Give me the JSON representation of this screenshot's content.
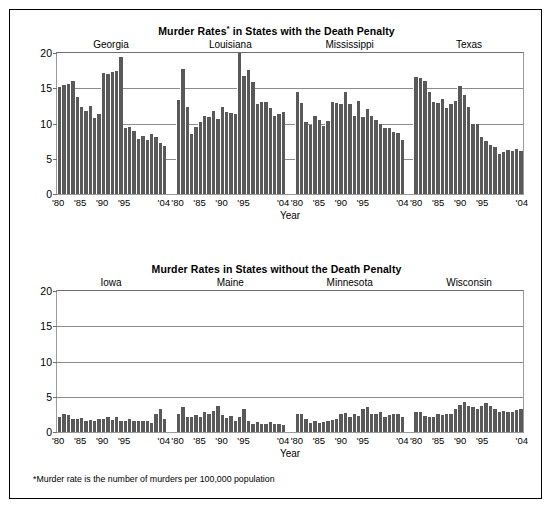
{
  "figure": {
    "footnote": "*Murder rate is the number of murders per 100,000 population",
    "bar_color": "#595959",
    "grid_color": "#8c8c8c",
    "frame_color": "#000000"
  },
  "chart_data": [
    {
      "type": "bar",
      "title": "Murder Rates* in States with the Death Penalty",
      "title_plain": "Murder Rates",
      "title_sup": "*",
      "title_rest": " in States with the Death Penalty",
      "xlabel": "Year",
      "ylabel": "",
      "ylim": [
        0,
        20
      ],
      "yticks": [
        0,
        5,
        10,
        15,
        20
      ],
      "ytick_labels": [
        "0",
        "5",
        "10",
        "15",
        "20"
      ],
      "grid": true,
      "legend": "none",
      "x": [
        1980,
        1981,
        1982,
        1983,
        1984,
        1985,
        1986,
        1987,
        1988,
        1989,
        1990,
        1991,
        1992,
        1993,
        1994,
        1995,
        1996,
        1997,
        1998,
        1999,
        2000,
        2001,
        2002,
        2003,
        2004
      ],
      "xtick_years": [
        1980,
        1985,
        1990,
        1995,
        2004
      ],
      "xtick_labels": [
        "'80",
        "'85",
        "'90",
        "'95",
        "'04"
      ],
      "panels": [
        {
          "name": "Georgia",
          "values": [
            15.2,
            15.4,
            15.6,
            16.0,
            13.7,
            12.4,
            11.8,
            12.5,
            10.8,
            11.3,
            17.2,
            17.0,
            17.3,
            17.5,
            19.4,
            9.4,
            9.5,
            9.0,
            7.8,
            8.2,
            7.7,
            8.5,
            8.1,
            7.2,
            6.8
          ]
        },
        {
          "name": "Louisiana",
          "values": [
            13.3,
            17.7,
            12.4,
            8.5,
            9.5,
            10.2,
            11.1,
            10.9,
            11.8,
            10.6,
            12.4,
            11.6,
            11.5,
            11.3,
            20.0,
            16.8,
            17.6,
            15.9,
            12.8,
            13.0,
            13.0,
            12.2,
            11.1,
            11.3,
            11.7
          ]
        },
        {
          "name": "Mississippi",
          "values": [
            14.4,
            12.9,
            10.2,
            9.8,
            11.0,
            10.5,
            9.6,
            10.3,
            13.0,
            12.9,
            12.7,
            14.5,
            12.8,
            11.0,
            13.2,
            10.9,
            12.0,
            11.1,
            10.5,
            9.9,
            9.4,
            9.3,
            8.8,
            8.7,
            7.7
          ]
        },
        {
          "name": "Texas",
          "values": [
            16.6,
            16.5,
            16.1,
            14.4,
            13.1,
            12.9,
            13.5,
            12.2,
            12.7,
            13.2,
            15.3,
            14.0,
            12.3,
            10.0,
            10.0,
            8.1,
            7.5,
            7.0,
            6.7,
            5.7,
            5.9,
            6.2,
            6.1,
            6.4,
            6.1
          ]
        }
      ]
    },
    {
      "type": "bar",
      "title": "Murder Rates in States without the Death Penalty",
      "title_plain": "Murder Rates in States without the Death Penalty",
      "title_sup": "",
      "title_rest": "",
      "xlabel": "Year",
      "ylabel": "",
      "ylim": [
        0,
        20
      ],
      "yticks": [
        0,
        5,
        10,
        15,
        20
      ],
      "ytick_labels": [
        "0",
        "5",
        "10",
        "15",
        "20"
      ],
      "grid": true,
      "legend": "none",
      "x": [
        1980,
        1981,
        1982,
        1983,
        1984,
        1985,
        1986,
        1987,
        1988,
        1989,
        1990,
        1991,
        1992,
        1993,
        1994,
        1995,
        1996,
        1997,
        1998,
        1999,
        2000,
        2001,
        2002,
        2003,
        2004
      ],
      "xtick_years": [
        1980,
        1985,
        1990,
        1995,
        2004
      ],
      "xtick_labels": [
        "'80",
        "'85",
        "'90",
        "'95",
        "'04"
      ],
      "panels": [
        {
          "name": "Iowa",
          "values": [
            2.2,
            2.6,
            2.4,
            1.9,
            1.8,
            2.0,
            1.6,
            1.7,
            1.6,
            1.9,
            1.9,
            2.1,
            1.7,
            2.2,
            1.6,
            1.6,
            1.8,
            1.6,
            1.6,
            1.5,
            1.6,
            1.3,
            2.5,
            3.2,
            1.9
          ]
        },
        {
          "name": "Maine",
          "values": [
            2.5,
            3.5,
            2.1,
            2.2,
            2.4,
            2.1,
            2.8,
            2.5,
            3.0,
            3.7,
            2.4,
            2.0,
            2.3,
            1.6,
            2.2,
            3.2,
            1.6,
            1.2,
            1.4,
            1.2,
            1.2,
            1.4,
            1.2,
            1.1,
            1.0
          ]
        },
        {
          "name": "Minnesota",
          "values": [
            2.6,
            2.6,
            1.8,
            1.3,
            1.5,
            1.3,
            1.4,
            1.6,
            1.7,
            1.9,
            2.6,
            2.7,
            2.2,
            2.5,
            2.3,
            3.3,
            3.5,
            2.6,
            2.5,
            2.8,
            2.1,
            2.4,
            2.5,
            2.5,
            2.2
          ]
        },
        {
          "name": "Wisconsin",
          "values": [
            2.9,
            2.8,
            2.3,
            2.2,
            2.2,
            2.5,
            2.4,
            2.6,
            2.6,
            3.3,
            3.8,
            4.2,
            3.7,
            3.5,
            3.2,
            3.7,
            4.1,
            3.7,
            3.2,
            2.8,
            3.0,
            2.8,
            2.9,
            3.1,
            3.3
          ]
        }
      ]
    }
  ]
}
